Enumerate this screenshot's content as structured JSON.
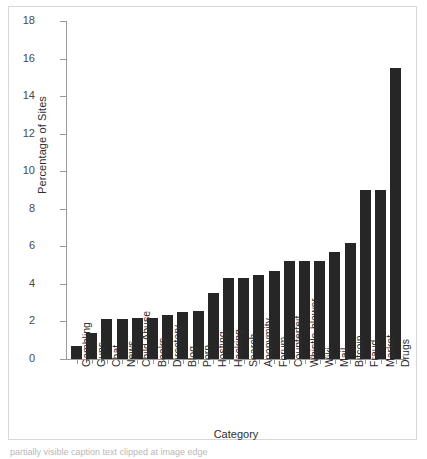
{
  "chart_data": {
    "type": "bar",
    "title": "",
    "xlabel": "Category",
    "ylabel": "Percentage of Sites",
    "ylim": [
      0,
      18
    ],
    "yticks": [
      0,
      2,
      4,
      6,
      8,
      10,
      12,
      14,
      16,
      18
    ],
    "grid": false,
    "legend": null,
    "bar_color": "#262626",
    "categories": [
      "Gambling",
      "Guns",
      "Chat",
      "News",
      "Child Abuse",
      "Books",
      "Directory",
      "Blog",
      "Porn",
      "Hosting",
      "Hacking",
      "Search",
      "Anonymity",
      "Forum",
      "Counterfeit",
      "Whistle-blower",
      "Wiki",
      "Mail",
      "Bitcoin",
      "Fraud",
      "Market",
      "Drugs"
    ],
    "values": [
      0.7,
      1.4,
      2.15,
      2.15,
      2.2,
      2.2,
      2.35,
      2.5,
      2.55,
      3.5,
      4.3,
      4.3,
      4.5,
      4.7,
      5.2,
      5.2,
      5.2,
      5.7,
      6.2,
      9.0,
      9.0,
      15.5
    ]
  },
  "caption": {
    "text": "partially visible caption text clipped at image edge"
  }
}
